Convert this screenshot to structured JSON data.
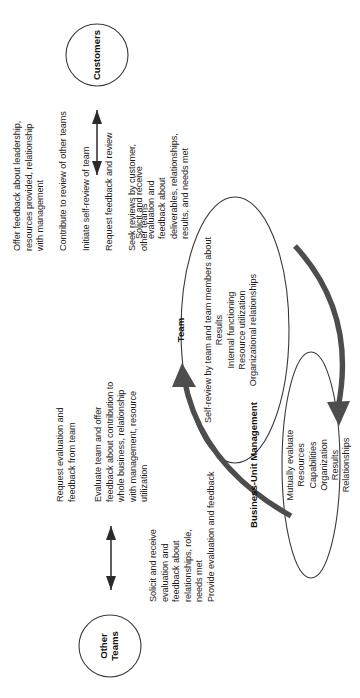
{
  "diagram": {
    "orientation": "rotated-90-ccw",
    "stroke_color": "#333333",
    "thick_arrow_color": "#4d4d4d",
    "background": "#ffffff"
  },
  "nodes": {
    "business_unit_management": {
      "label": "Business-Unit Management",
      "shape": "ellipse",
      "body": "Mutually evaluate\nResources\nCapabilities\nOrganization\nResults\nRelationships"
    },
    "team": {
      "label": "Team",
      "shape": "ellipse",
      "body": "Self-review by team and team members about\nResults\nInternal functioning\nResource utilization\nOrganizational relationships"
    },
    "customers": {
      "label": "Customers",
      "shape": "circle"
    },
    "other_teams": {
      "label": "Other\nTeams",
      "shape": "circle"
    }
  },
  "annotations": {
    "team_to_management": {
      "lines": [
        "Offer feedback about leadership,",
        "resources provided, relationship",
        "with management"
      ],
      "line2": "Contribute to review of other teams",
      "line3": "Initiate self-review of team",
      "line4": "Request feedback and review",
      "line5": "Seek reviews by customer,\nother teams"
    },
    "management_to_team": {
      "block1": "Request evaluation and\nfeedback from team",
      "block2": "Evaluate team and offer\nfeedback about contribution to\nwhole business, relationship\nwith management, resource\nutilization"
    },
    "customers_exchange": {
      "text": "Solicit and receive\nevaluation and\nfeedback about\ndeliverables, relationships,\nresults, and needs met"
    },
    "other_teams_exchange": {
      "text": "Solicit and receive\nevaluation and\nfeedback about\nrelationships, role,\nneeds met",
      "extra": "Provide evaluation and feedback"
    }
  },
  "arrows": {
    "curved_team_to_management": "curved thick arrow pointing to Business-Unit Management",
    "curved_management_to_team": "curved thick arrow pointing to Team",
    "customers_double": "double-headed vertical arrow",
    "other_teams_double": "double-headed vertical arrow"
  }
}
